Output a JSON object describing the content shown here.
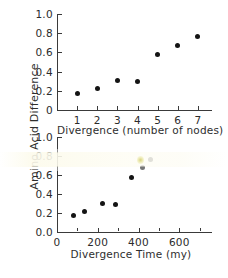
{
  "figure": {
    "shared_y_axis_label": "Amino Acid Difference",
    "background_color": "#ffffff",
    "point_color": "#141414",
    "axis_color": "#3a3a3a"
  },
  "chart_data": [
    {
      "type": "scatter",
      "panel": "top",
      "title": "",
      "xlabel": "Divergence (number of nodes)",
      "ylabel": "Amino Acid Difference",
      "x": [
        1,
        2,
        3,
        4,
        5,
        6,
        7
      ],
      "y": [
        0.17,
        0.22,
        0.305,
        0.295,
        0.575,
        0.675,
        0.765
      ],
      "xlim": [
        0,
        7.7
      ],
      "ylim": [
        0,
        1.0
      ],
      "xticks": [
        1,
        2,
        3,
        4,
        5,
        6,
        7
      ],
      "xtick_labels": [
        "1",
        "2",
        "3",
        "4",
        "5",
        "6",
        "7"
      ],
      "yticks": [
        0,
        0.2,
        0.4,
        0.6,
        0.8,
        1.0
      ],
      "ytick_labels": [
        "0",
        "0.2",
        "0.4",
        "0.6",
        "0.8",
        "1.0"
      ],
      "grid": false,
      "legend": null
    },
    {
      "type": "scatter",
      "panel": "bottom",
      "title": "",
      "xlabel": "Divergence Time (my)",
      "ylabel": "Amino Acid Difference",
      "x": [
        80,
        135,
        225,
        285,
        365,
        420,
        460
      ],
      "y": [
        0.17,
        0.22,
        0.305,
        0.29,
        0.575,
        0.675,
        0.765
      ],
      "xlim": [
        0,
        760
      ],
      "ylim": [
        0.0,
        1.0
      ],
      "xticks": [
        0,
        100,
        200,
        300,
        400,
        500,
        600,
        700
      ],
      "xtick_labels": [
        "0",
        "",
        "200",
        "",
        "400",
        "",
        "600",
        ""
      ],
      "major_xticks": [
        0,
        200,
        400,
        600
      ],
      "yticks": [
        0.0,
        0.2,
        0.4,
        0.6,
        0.8,
        1.0
      ],
      "ytick_labels": [
        "0.0",
        "0.2",
        "0.4",
        "0.6",
        "0.8",
        "1.0"
      ],
      "grid": false,
      "legend": null,
      "notes": "Horizontal scan artifact fades the 0.8 tick label and the highest data point."
    }
  ]
}
